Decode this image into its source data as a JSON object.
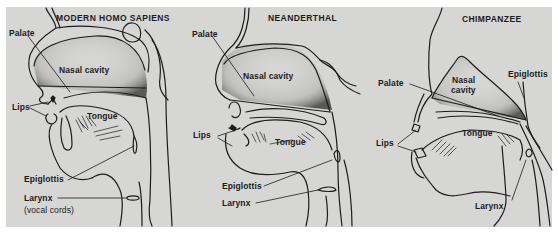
{
  "figure": {
    "background_color": "#d6d6d4",
    "line_color": "#1c1c1c",
    "panels": [
      {
        "title": "MODERN HOMO SAPIENS",
        "labels": {
          "palate": "Palate",
          "nasal_cavity": "Nasal cavity",
          "lips": "Lips",
          "tongue": "Tongue",
          "epiglottis": "Epiglottis",
          "larynx": "Larynx",
          "larynx_note": "(vocal cords)"
        }
      },
      {
        "title": "NEANDERTHAL",
        "labels": {
          "palate": "Palate",
          "nasal_cavity": "Nasal cavity",
          "lips": "Lips",
          "tongue": "Tongue",
          "epiglottis": "Epiglottis",
          "larynx": "Larynx"
        }
      },
      {
        "title": "CHIMPANZEE",
        "labels": {
          "palate": "Palate",
          "nasal_cavity_line1": "Nasal",
          "nasal_cavity_line2": "cavity",
          "epiglottis": "Epiglottis",
          "lips": "Lips",
          "tongue": "Tongue",
          "larynx": "Larynx"
        }
      }
    ]
  }
}
